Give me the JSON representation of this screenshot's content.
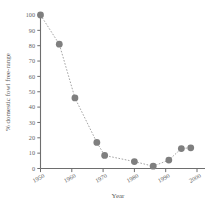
{
  "chart_data": {
    "type": "scatter",
    "title": "",
    "xlabel": "Year",
    "ylabel": "% domestic fowl free-range",
    "xlim": [
      1950,
      2000
    ],
    "ylim": [
      0,
      100
    ],
    "xticks": [
      1950,
      1960,
      1970,
      1980,
      1990,
      2000
    ],
    "xticklabels": [
      "1950",
      "1960",
      "1970",
      "1980",
      "1990",
      "2000"
    ],
    "yticks": [
      0,
      10,
      20,
      30,
      40,
      50,
      60,
      70,
      80,
      90,
      100
    ],
    "yticklabels": [
      "0",
      "10",
      "20",
      "30",
      "40",
      "50",
      "60",
      "70",
      "80",
      "90",
      "100"
    ],
    "grid": false,
    "legend": false,
    "connector": "dotted-line",
    "marker": "filled-circle",
    "marker_color": "#7f7f7f",
    "line_color": "#9a9a9a",
    "axis_color": "#6e6e6e",
    "x": [
      1950,
      1956,
      1961,
      1968,
      1970.5,
      1980,
      1986,
      1991,
      1995,
      1998
    ],
    "values": [
      100,
      81,
      46,
      17,
      8.5,
      4.5,
      1.5,
      5.5,
      13,
      13.5
    ],
    "points": [
      {
        "x": 1950,
        "y": 100
      },
      {
        "x": 1956,
        "y": 81
      },
      {
        "x": 1961,
        "y": 46
      },
      {
        "x": 1968,
        "y": 17
      },
      {
        "x": 1970.5,
        "y": 8.5
      },
      {
        "x": 1980,
        "y": 4.5
      },
      {
        "x": 1986,
        "y": 1.5
      },
      {
        "x": 1991,
        "y": 5.5
      },
      {
        "x": 1995,
        "y": 13
      },
      {
        "x": 1998,
        "y": 13.5
      }
    ]
  }
}
